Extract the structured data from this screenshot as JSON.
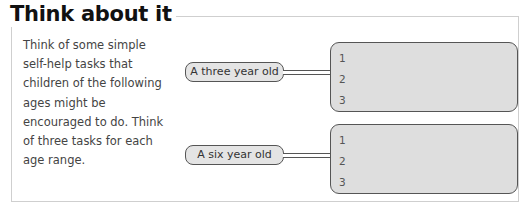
{
  "title": "Think about it",
  "prompt": "Think of some simple self-help tasks that children of the following ages might be encouraged to do. Think of three tasks for each age range.",
  "groups": [
    {
      "label": "A three year old",
      "answers": [
        "1",
        "2",
        "3"
      ]
    },
    {
      "label": "A six year old",
      "answers": [
        "1",
        "2",
        "3"
      ]
    }
  ],
  "colors": {
    "box_fill": "#dedede",
    "pill_fill": "#e4e4e4",
    "outline": "#555555",
    "frame": "#cfcfcf"
  }
}
